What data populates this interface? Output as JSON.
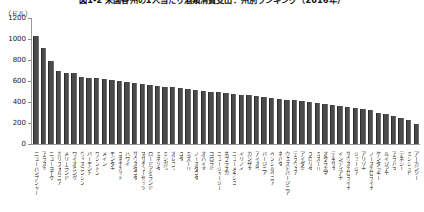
{
  "figure": {
    "title": "図1-2 米国各州の1人当たり酒類消費支出：州別ランキング（2016年）",
    "y_unit_label": "（ドル）"
  },
  "chart_data": {
    "type": "bar",
    "title": "図1-2 米国各州の1人当たり酒類消費支出：州別ランキング（2016年）",
    "xlabel": "",
    "ylabel": "（ドル）",
    "ylim": [
      0,
      1200
    ],
    "yticks": [
      0,
      200,
      400,
      600,
      800,
      1000,
      1200
    ],
    "ytick_labels": [
      "0",
      "200",
      "400",
      "600",
      "800",
      "1000",
      "1200"
    ],
    "grid": false,
    "legend": "none",
    "bar_color": "#4a4a4a",
    "categories": [
      "ニューハンプシャー",
      "アラスカ",
      "ニューヨーク",
      "カリフォルニア",
      "メリーランド",
      "ワイオミング",
      "ウィスコンシン",
      "バーモント",
      "ワシントン",
      "メイン",
      "モンタナ",
      "コネチカット",
      "ハワイ",
      "サウスダコタ",
      "マサチューセッツ",
      "ロードアイランド",
      "ミネソタ",
      "ミシガン",
      "オレゴン",
      "ユタ",
      "ミズーリ",
      "ノースダコタ",
      "オハイオ",
      "コロラド",
      "ニュージャージー",
      "ネブラスカ",
      "ニューメキシコ",
      "イリノイ",
      "カンザス",
      "アイオワ",
      "バージニア",
      "ペンシルベニア",
      "ネバダ",
      "ウェストバージニア",
      "デラウェア",
      "アイダホ",
      "フロリダ",
      "ミズーリ",
      "オクラホマ",
      "テキサス",
      "インディアナ",
      "サウスカロライナ",
      "ジョージア",
      "アリゾナ",
      "ノースカロライナ",
      "ケンタッキー",
      "ルイジアナ",
      "アラバマ",
      "テネシー",
      "ミシシッピ",
      "アーカンソー"
    ],
    "values": [
      1030,
      915,
      790,
      700,
      680,
      675,
      640,
      630,
      625,
      620,
      610,
      600,
      595,
      585,
      575,
      560,
      550,
      545,
      540,
      530,
      520,
      515,
      505,
      500,
      495,
      490,
      480,
      470,
      465,
      455,
      450,
      440,
      430,
      420,
      415,
      405,
      400,
      390,
      380,
      370,
      360,
      350,
      340,
      330,
      320,
      300,
      285,
      270,
      250,
      225,
      195
    ]
  }
}
